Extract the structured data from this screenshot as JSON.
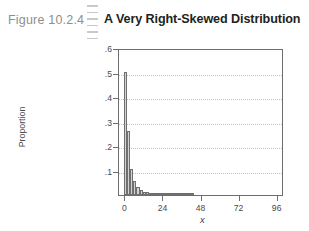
{
  "figure": {
    "number_label": "Figure 10.2.4",
    "title": "A Very Right-Skewed Distribution",
    "rule_dash_count": 6
  },
  "colors": {
    "figure_number": "#8e8e8e",
    "title": "#231f20",
    "frame": "#6d6d6d",
    "bar_fill": "#d2d2d2",
    "bar_stroke": "#6f6f6f",
    "gridline": "#c2c2c2",
    "background": "#ffffff"
  },
  "chart_data": {
    "type": "bar",
    "title": "A Very Right-Skewed Distribution",
    "xlabel": "x",
    "ylabel": "Proportion",
    "xlim": [
      -4,
      100
    ],
    "ylim": [
      0,
      0.6
    ],
    "grid": true,
    "legend": null,
    "xticks": [
      0,
      24,
      48,
      72,
      96
    ],
    "xtick_labels": [
      "0",
      "24",
      "48",
      "72",
      "96"
    ],
    "yticks": [
      0.1,
      0.2,
      0.3,
      0.4,
      0.5,
      0.6
    ],
    "ytick_labels": [
      ".1",
      ".2",
      ".3",
      ".4",
      ".5",
      ".6"
    ],
    "bin_width": 2,
    "x": [
      0,
      2,
      4,
      6,
      8,
      10,
      12,
      14,
      16,
      18,
      20,
      22,
      24,
      26,
      28,
      30,
      32,
      34,
      36,
      38,
      40,
      42
    ],
    "values": [
      0.502,
      0.262,
      0.108,
      0.058,
      0.032,
      0.021,
      0.014,
      0.011,
      0.009,
      0.007,
      0.006,
      0.005,
      0.004,
      0.003,
      0.003,
      0.002,
      0.002,
      0.002,
      0.001,
      0.001,
      0.001,
      0.001
    ],
    "categories": [
      "0",
      "2",
      "4",
      "6",
      "8",
      "10",
      "12",
      "14",
      "16",
      "18",
      "20",
      "22",
      "24",
      "26",
      "28",
      "30",
      "32",
      "34",
      "36",
      "38",
      "40",
      "42"
    ]
  }
}
